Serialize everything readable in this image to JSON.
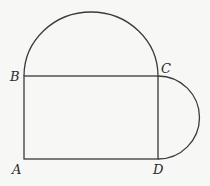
{
  "diagram": {
    "points": [
      {
        "label": "A",
        "x": 24,
        "y": 159
      },
      {
        "label": "B",
        "x": 24,
        "y": 76
      },
      {
        "label": "C",
        "x": 158,
        "y": 76
      },
      {
        "label": "D",
        "x": 158,
        "y": 159
      }
    ],
    "labels": {
      "A": "A",
      "B": "B",
      "C": "C",
      "D": "D"
    },
    "colors": {
      "stroke": "#3a3a3a",
      "background": "#f7f7f5"
    }
  }
}
